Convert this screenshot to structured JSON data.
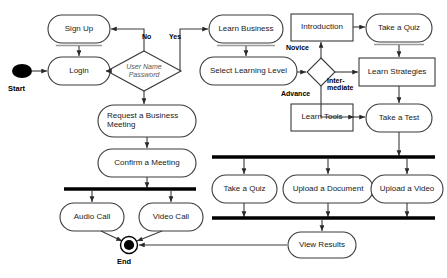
{
  "diagram": {
    "background_color": "#ffffff",
    "stroke_color": "#3a3a3a",
    "bar_color": "#000000",
    "text_color": "#1a1a1a"
  },
  "terminals": [
    {
      "id": "start",
      "label": "Start",
      "type": "initial-node",
      "cx": 22,
      "cy": 71,
      "r": 8.5
    },
    {
      "id": "end",
      "label": "End",
      "type": "final-node",
      "cx": 129,
      "cy": 245,
      "r": 8.5
    }
  ],
  "decisions": [
    {
      "id": "credentials",
      "line1": "User Name",
      "line2": "Password",
      "cx": 144,
      "cy": 71,
      "rx": 37,
      "ry": 20
    },
    {
      "id": "learning-level",
      "line1": "",
      "line2": "",
      "cx": 321,
      "cy": 72,
      "rx": 14,
      "ry": 14
    }
  ],
  "actions": [
    {
      "id": "sign-up",
      "label": "Sign Up",
      "shape": "rounded",
      "x": 48,
      "y": 15,
      "w": 62,
      "h": 28,
      "fontsize": 8,
      "shadow": true
    },
    {
      "id": "login",
      "label": "Login",
      "shape": "rounded",
      "x": 48,
      "y": 57,
      "w": 62,
      "h": 28,
      "fontsize": 8,
      "shadow": false
    },
    {
      "id": "request-business-meeting",
      "label": "Request a Business\nMeeting",
      "shape": "rounded",
      "x": 98,
      "y": 105,
      "w": 98,
      "h": 32,
      "fontsize": 8,
      "shadow": false,
      "align": "left"
    },
    {
      "id": "confirm-a-meeting",
      "label": "Confirm a Meeting",
      "shape": "rounded",
      "x": 98,
      "y": 149,
      "w": 98,
      "h": 28,
      "fontsize": 8,
      "shadow": false
    },
    {
      "id": "audio-call",
      "label": "Audio Call",
      "shape": "rounded",
      "x": 60,
      "y": 203,
      "w": 64,
      "h": 28,
      "fontsize": 8,
      "shadow": false
    },
    {
      "id": "video-call",
      "label": "Video Call",
      "shape": "rounded",
      "x": 139,
      "y": 203,
      "w": 64,
      "h": 28,
      "fontsize": 8,
      "shadow": false
    },
    {
      "id": "learn-business",
      "label": "Learn Business",
      "shape": "rounded",
      "x": 209,
      "y": 15,
      "w": 74,
      "h": 28,
      "fontsize": 8,
      "shadow": true
    },
    {
      "id": "select-learning-level",
      "label": "Select Learning Level",
      "shape": "rounded",
      "x": 200,
      "y": 57,
      "w": 97,
      "h": 28,
      "fontsize": 8,
      "shadow": false
    },
    {
      "id": "introduction",
      "label": "Introduction",
      "shape": "rect",
      "x": 291,
      "y": 14,
      "w": 62,
      "h": 27,
      "fontsize": 8,
      "shadow": false
    },
    {
      "id": "take-a-quiz-top",
      "label": "Take a Quiz",
      "shape": "rounded",
      "x": 366,
      "y": 14,
      "w": 66,
      "h": 28,
      "fontsize": 8,
      "shadow": true
    },
    {
      "id": "learn-strategies",
      "label": "Learn Strategies",
      "shape": "rect",
      "x": 359,
      "y": 58,
      "w": 76,
      "h": 28,
      "fontsize": 8,
      "shadow": false
    },
    {
      "id": "learn-tools",
      "label": "Learn Tools",
      "shape": "rect",
      "x": 291,
      "y": 104,
      "w": 62,
      "h": 27,
      "fontsize": 8,
      "shadow": false
    },
    {
      "id": "take-a-test",
      "label": "Take a Test",
      "shape": "rounded",
      "x": 366,
      "y": 104,
      "w": 66,
      "h": 28,
      "fontsize": 8,
      "shadow": false
    },
    {
      "id": "take-a-quiz-bottom",
      "label": "Take a Quiz",
      "shape": "rounded",
      "x": 212,
      "y": 175,
      "w": 65,
      "h": 28,
      "fontsize": 8,
      "shadow": false
    },
    {
      "id": "upload-a-document",
      "label": "Upload a Document",
      "shape": "rounded",
      "x": 283,
      "y": 175,
      "w": 90,
      "h": 28,
      "fontsize": 8,
      "shadow": false
    },
    {
      "id": "upload-a-video",
      "label": "Upload a Video",
      "shape": "rounded",
      "x": 371,
      "y": 175,
      "w": 72,
      "h": 28,
      "fontsize": 8,
      "shadow": false
    },
    {
      "id": "view-results",
      "label": "View Results",
      "shape": "rounded",
      "x": 288,
      "y": 232,
      "w": 68,
      "h": 26,
      "fontsize": 8,
      "shadow": false
    }
  ],
  "bars": [
    {
      "id": "fork-bar-call",
      "x1": 64,
      "x2": 196,
      "y": 189,
      "thickness": 3.5
    },
    {
      "id": "fork-bar-learning",
      "x1": 212,
      "x2": 435,
      "y": 157,
      "thickness": 3.5
    },
    {
      "id": "join-bar-learning",
      "x1": 212,
      "x2": 435,
      "y": 218,
      "thickness": 3.5
    }
  ],
  "edge_labels": [
    {
      "id": "label-no",
      "text": "No",
      "x": 142,
      "y": 33,
      "fontsize": 7
    },
    {
      "id": "label-yes",
      "text": "Yes",
      "x": 169,
      "y": 33,
      "fontsize": 7
    },
    {
      "id": "label-novice",
      "text": "Novice",
      "x": 286,
      "y": 44,
      "fontsize": 7
    },
    {
      "id": "label-intermediate",
      "text": "Inter-\nmediate",
      "x": 327,
      "y": 77,
      "fontsize": 7
    },
    {
      "id": "label-advance",
      "text": "Advance",
      "x": 281,
      "y": 90,
      "fontsize": 7
    }
  ],
  "terminal_labels": [
    {
      "id": "start-label",
      "text": "Start",
      "x": 8,
      "y": 84,
      "fontsize": 7.5
    },
    {
      "id": "end-label",
      "text": "End",
      "x": 117,
      "y": 257,
      "fontsize": 7.5
    }
  ],
  "flows": [
    {
      "from": "start",
      "to": "login"
    },
    {
      "from": "login",
      "to": "credentials"
    },
    {
      "from": "credentials",
      "to": "sign-up",
      "label": "No"
    },
    {
      "from": "sign-up",
      "to": "login"
    },
    {
      "from": "credentials",
      "to": "learn-business",
      "label": "Yes"
    },
    {
      "from": "credentials",
      "to": "request-business-meeting"
    },
    {
      "from": "request-business-meeting",
      "to": "confirm-a-meeting"
    },
    {
      "from": "confirm-a-meeting",
      "to": "fork-bar-call"
    },
    {
      "from": "fork-bar-call",
      "to": "audio-call"
    },
    {
      "from": "fork-bar-call",
      "to": "video-call"
    },
    {
      "from": "audio-call",
      "to": "end"
    },
    {
      "from": "video-call",
      "to": "end"
    },
    {
      "from": "learn-business",
      "to": "select-learning-level"
    },
    {
      "from": "select-learning-level",
      "to": "learning-level"
    },
    {
      "from": "learning-level",
      "to": "introduction",
      "label": "Novice"
    },
    {
      "from": "learning-level",
      "to": "learn-strategies",
      "label": "Intermediate"
    },
    {
      "from": "learning-level",
      "to": "learn-tools",
      "label": "Advance"
    },
    {
      "from": "introduction",
      "to": "take-a-quiz-top"
    },
    {
      "from": "take-a-quiz-top",
      "to": "learn-strategies"
    },
    {
      "from": "learn-strategies",
      "to": "take-a-test"
    },
    {
      "from": "learn-tools",
      "to": "take-a-test"
    },
    {
      "from": "take-a-test",
      "to": "fork-bar-learning"
    },
    {
      "from": "fork-bar-learning",
      "to": "take-a-quiz-bottom"
    },
    {
      "from": "fork-bar-learning",
      "to": "upload-a-document"
    },
    {
      "from": "fork-bar-learning",
      "to": "upload-a-video"
    },
    {
      "from": "take-a-quiz-bottom",
      "to": "join-bar-learning"
    },
    {
      "from": "upload-a-document",
      "to": "join-bar-learning"
    },
    {
      "from": "upload-a-video",
      "to": "join-bar-learning"
    },
    {
      "from": "join-bar-learning",
      "to": "view-results"
    },
    {
      "from": "view-results",
      "to": "end"
    }
  ]
}
